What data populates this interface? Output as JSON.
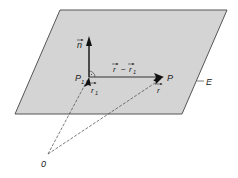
{
  "diagram": {
    "type": "vector-geometry-plane",
    "plane": {
      "label": "E",
      "fill": "#d4d4d4",
      "stroke": "#555555",
      "corners": [
        [
          60,
          10
        ],
        [
          227,
          10
        ],
        [
          182,
          114
        ],
        [
          15,
          114
        ]
      ]
    },
    "points": {
      "P1": {
        "label": "P",
        "subscript": "1",
        "x": 89,
        "y": 77
      },
      "P": {
        "label": "P",
        "subscript": "",
        "x": 163,
        "y": 77
      },
      "O": {
        "label": "0",
        "x": 48,
        "y": 155
      }
    },
    "vectors": [
      {
        "id": "n",
        "label": "n",
        "subscript": "",
        "from": "P1",
        "to": [
          89,
          36
        ],
        "style": "bold"
      },
      {
        "id": "r-r1",
        "label": "r − r",
        "subscript": "1",
        "from": "P1",
        "to": "P",
        "style": "solid"
      },
      {
        "id": "r1",
        "label": "r",
        "subscript": "1",
        "from": "O",
        "to": "P1",
        "style": "dashed"
      },
      {
        "id": "r",
        "label": "r",
        "subscript": "",
        "from": "O",
        "to": "P",
        "style": "dashed"
      }
    ],
    "annotations": {
      "right_angle_marker": "between n and r−r1 at P1",
      "plane_label": "E"
    },
    "colors": {
      "line": "#333333",
      "background": "#ffffff"
    }
  }
}
